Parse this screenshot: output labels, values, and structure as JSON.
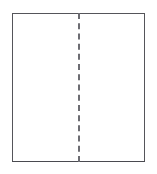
{
  "figure": {
    "title": "",
    "caption": "",
    "background_color": "#ffffff",
    "width": 157,
    "height": 174
  },
  "diagram": {
    "type": "line-drawing",
    "shapes": [
      {
        "name": "outer-rectangle",
        "kind": "rectangle",
        "stroke_color": "#55555a",
        "stroke_width": 1,
        "stroke_style": "solid",
        "fill_color": "#ffffff",
        "x": 12,
        "y": 13,
        "width": 133,
        "height": 149,
        "label": ""
      },
      {
        "name": "center-dashed-divider",
        "kind": "line",
        "stroke_color": "#6c6c72",
        "stroke_width": 2,
        "stroke_style": "dashed",
        "dash_length": 12,
        "gap_length": 6,
        "orientation": "vertical",
        "x1": 78,
        "y1": 13,
        "x2": 78,
        "y2": 162,
        "label": ""
      }
    ],
    "regions": [
      {
        "name": "left-half",
        "label": ""
      },
      {
        "name": "right-half",
        "label": ""
      }
    ],
    "annotations": []
  }
}
